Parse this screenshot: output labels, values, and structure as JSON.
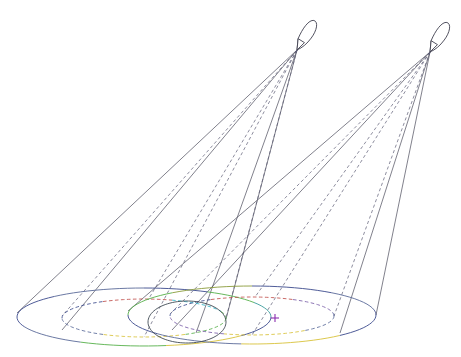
{
  "figure": {
    "background_color": "#ffffff",
    "canvas": {
      "width": 461,
      "height": 357
    }
  },
  "style": {
    "line_color_solid": "#4a4a5a",
    "line_color_dashed": "#5b5b74",
    "aircraft_outline": "#3c3c4c",
    "target_color": "#8b2fb0"
  },
  "palette": {
    "navy": "#3b4a8c",
    "steel": "#5a6a99",
    "red": "#c0504d",
    "cyan": "#2fb5c8",
    "green": "#56b04a",
    "yellow": "#d8c23a",
    "violet": "#7a5fa8",
    "teal": "#3a9b9b",
    "olive": "#8a9b3a"
  },
  "aircraft": [
    {
      "id": "aircraft-left",
      "label": "Left platform",
      "apex": {
        "x": 297,
        "y": 50
      },
      "heading_deg": 58,
      "body_length": 34,
      "body_width": 11
    },
    {
      "id": "aircraft-right",
      "label": "Right platform",
      "apex": {
        "x": 430,
        "y": 52
      },
      "heading_deg": 58,
      "body_length": 34,
      "body_width": 11
    }
  ],
  "footprints": [
    {
      "id": "footprint-left-outer",
      "label": "Left outer coverage ellipse",
      "style": "solid",
      "cx": 144,
      "cy": 317,
      "rx": 127,
      "ry": 29,
      "segments": [
        {
          "from_deg": 180,
          "to_deg": 225,
          "color": "#3b4a8c"
        },
        {
          "from_deg": 225,
          "to_deg": 270,
          "color": "#5a6a99"
        },
        {
          "from_deg": 270,
          "to_deg": 300,
          "color": "#3b4a8c"
        },
        {
          "from_deg": 300,
          "to_deg": 330,
          "color": "#56b04a"
        },
        {
          "from_deg": 330,
          "to_deg": 360,
          "color": "#3a9b9b"
        },
        {
          "from_deg": 0,
          "to_deg": 40,
          "color": "#3b4a8c"
        },
        {
          "from_deg": 40,
          "to_deg": 80,
          "color": "#d8c23a"
        },
        {
          "from_deg": 80,
          "to_deg": 120,
          "color": "#56b04a"
        },
        {
          "from_deg": 120,
          "to_deg": 160,
          "color": "#5a6a99"
        },
        {
          "from_deg": 160,
          "to_deg": 180,
          "color": "#3b4a8c"
        }
      ]
    },
    {
      "id": "footprint-left-inner",
      "label": "Left inner coverage ellipse",
      "style": "dashed",
      "cx": 144,
      "cy": 318,
      "rx": 82,
      "ry": 19,
      "segments": [
        {
          "from_deg": 180,
          "to_deg": 240,
          "color": "#3b4a8c"
        },
        {
          "from_deg": 240,
          "to_deg": 290,
          "color": "#c0504d"
        },
        {
          "from_deg": 290,
          "to_deg": 340,
          "color": "#2fb5c8"
        },
        {
          "from_deg": 340,
          "to_deg": 360,
          "color": "#56b04a"
        },
        {
          "from_deg": 0,
          "to_deg": 60,
          "color": "#56b04a"
        },
        {
          "from_deg": 60,
          "to_deg": 120,
          "color": "#d8c23a"
        },
        {
          "from_deg": 120,
          "to_deg": 180,
          "color": "#5a6a99"
        }
      ]
    },
    {
      "id": "footprint-right-outer",
      "label": "Right outer coverage ellipse",
      "style": "solid",
      "cx": 252,
      "cy": 315,
      "rx": 124,
      "ry": 29,
      "segments": [
        {
          "from_deg": 180,
          "to_deg": 230,
          "color": "#56b04a"
        },
        {
          "from_deg": 230,
          "to_deg": 270,
          "color": "#8a9b3a"
        },
        {
          "from_deg": 270,
          "to_deg": 310,
          "color": "#3b4a8c"
        },
        {
          "from_deg": 310,
          "to_deg": 350,
          "color": "#5a6a99"
        },
        {
          "from_deg": 350,
          "to_deg": 360,
          "color": "#3b4a8c"
        },
        {
          "from_deg": 0,
          "to_deg": 45,
          "color": "#3b4a8c"
        },
        {
          "from_deg": 45,
          "to_deg": 95,
          "color": "#d8c23a"
        },
        {
          "from_deg": 95,
          "to_deg": 140,
          "color": "#5a6a99"
        },
        {
          "from_deg": 140,
          "to_deg": 180,
          "color": "#3b4a8c"
        }
      ]
    },
    {
      "id": "footprint-right-inner",
      "label": "Right inner coverage ellipse",
      "style": "dashed",
      "cx": 252,
      "cy": 316,
      "rx": 82,
      "ry": 19,
      "segments": [
        {
          "from_deg": 180,
          "to_deg": 240,
          "color": "#3b4a8c"
        },
        {
          "from_deg": 240,
          "to_deg": 300,
          "color": "#c0504d"
        },
        {
          "from_deg": 300,
          "to_deg": 350,
          "color": "#7a5fa8"
        },
        {
          "from_deg": 350,
          "to_deg": 360,
          "color": "#3b4a8c"
        },
        {
          "from_deg": 0,
          "to_deg": 50,
          "color": "#5a6a99"
        },
        {
          "from_deg": 50,
          "to_deg": 110,
          "color": "#d8c23a"
        },
        {
          "from_deg": 110,
          "to_deg": 180,
          "color": "#7a5fa8"
        }
      ]
    },
    {
      "id": "footprint-overlap",
      "label": "Overlap region ellipse",
      "style": "solid",
      "cx": 187,
      "cy": 322,
      "rx": 39,
      "ry": 21,
      "segments": [
        {
          "from_deg": 0,
          "to_deg": 360,
          "color": "#3f4a52"
        }
      ]
    }
  ],
  "cones": [
    {
      "id": "cone-left",
      "label": "Left sensor cone",
      "apex": {
        "x": 297,
        "y": 50
      },
      "rays": [
        {
          "to": {
            "x": 17,
            "y": 313
          },
          "style": "solid"
        },
        {
          "to": {
            "x": 62,
            "y": 330
          },
          "style": "solid"
        },
        {
          "to": {
            "x": 226,
            "y": 319
          },
          "style": "solid"
        },
        {
          "to": {
            "x": 196,
            "y": 333
          },
          "style": "solid"
        },
        {
          "to": {
            "x": 62,
            "y": 316
          },
          "style": "dashed"
        },
        {
          "to": {
            "x": 144,
            "y": 337
          },
          "style": "dashed"
        },
        {
          "to": {
            "x": 226,
            "y": 318
          },
          "style": "dashed"
        },
        {
          "to": {
            "x": 148,
            "y": 300
          },
          "style": "dashed"
        }
      ]
    },
    {
      "id": "cone-right",
      "label": "Right sensor cone",
      "apex": {
        "x": 430,
        "y": 52
      },
      "rays": [
        {
          "to": {
            "x": 128,
            "y": 311
          },
          "style": "solid"
        },
        {
          "to": {
            "x": 172,
            "y": 330
          },
          "style": "solid"
        },
        {
          "to": {
            "x": 376,
            "y": 315
          },
          "style": "solid"
        },
        {
          "to": {
            "x": 340,
            "y": 333
          },
          "style": "solid"
        },
        {
          "to": {
            "x": 170,
            "y": 314
          },
          "style": "dashed"
        },
        {
          "to": {
            "x": 252,
            "y": 335
          },
          "style": "dashed"
        },
        {
          "to": {
            "x": 334,
            "y": 316
          },
          "style": "dashed"
        },
        {
          "to": {
            "x": 255,
            "y": 297
          },
          "style": "dashed"
        }
      ]
    }
  ],
  "target": {
    "id": "target-point",
    "label": "Target point",
    "x": 275,
    "y": 318,
    "size": 4,
    "color": "#8b2fb0"
  }
}
